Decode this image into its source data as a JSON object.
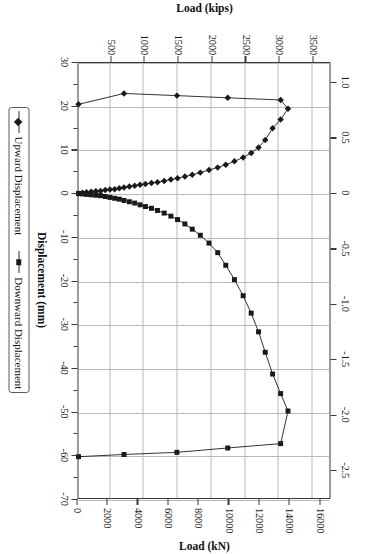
{
  "chart_data": {
    "type": "line",
    "title": "",
    "xlabel": "Displacement (mm)",
    "ylabel": "Load (kips)",
    "secondary_xlabel": "Displacement (in.)",
    "secondary_ylabel": "Load (kN)",
    "xlim": [
      30,
      -70
    ],
    "ylim": [
      0,
      3750
    ],
    "secondary_xlim": [
      1.18,
      -2.76
    ],
    "secondary_ylim": [
      0,
      16680
    ],
    "grid": true,
    "legend_position": "bottom",
    "x_ticks": [
      30,
      20,
      10,
      0,
      -10,
      -20,
      -30,
      -40,
      -50,
      -60,
      -70
    ],
    "x_tick_labels": [
      "30",
      "20",
      "10",
      "0",
      "-10",
      "-20",
      "-30",
      "-40",
      "-50",
      "-60",
      "-70"
    ],
    "y_ticks": [
      500,
      1000,
      1500,
      2000,
      2500,
      3000,
      3500
    ],
    "y_tick_labels": [
      "500",
      "1000",
      "1500",
      "2000",
      "2500",
      "3000",
      "3500"
    ],
    "top_ticks": [
      1.0,
      0.5,
      0,
      -0.5,
      -1.0,
      -1.5,
      -2.0,
      -2.5
    ],
    "top_tick_labels": [
      "1.0",
      "0.5",
      "0",
      "-0.5",
      "-1.0",
      "-1.5",
      "-2.0",
      "-2.5"
    ],
    "right_ticks": [
      0,
      2000,
      4000,
      6000,
      8000,
      10000,
      12000,
      14000,
      16000
    ],
    "right_tick_labels": [
      "0",
      "2000",
      "4000",
      "6000",
      "8000",
      "10000",
      "12000",
      "14000",
      "16000"
    ],
    "series": [
      {
        "name": "Upward Displacement",
        "marker": "diamond",
        "color": "#1a1a1a",
        "points": [
          [
            0,
            0
          ],
          [
            0.2,
            60
          ],
          [
            0.3,
            120
          ],
          [
            0.4,
            190
          ],
          [
            0.5,
            260
          ],
          [
            0.6,
            330
          ],
          [
            0.8,
            400
          ],
          [
            0.9,
            470
          ],
          [
            1.0,
            540
          ],
          [
            1.2,
            610
          ],
          [
            1.4,
            680
          ],
          [
            1.6,
            760
          ],
          [
            1.8,
            840
          ],
          [
            2.0,
            920
          ],
          [
            2.2,
            1000
          ],
          [
            2.4,
            1090
          ],
          [
            2.6,
            1180
          ],
          [
            2.9,
            1280
          ],
          [
            3.2,
            1380
          ],
          [
            3.5,
            1480
          ],
          [
            3.9,
            1590
          ],
          [
            4.3,
            1700
          ],
          [
            4.8,
            1820
          ],
          [
            5.4,
            1950
          ],
          [
            6.0,
            2080
          ],
          [
            6.6,
            2200
          ],
          [
            7.4,
            2330
          ],
          [
            8.3,
            2460
          ],
          [
            9.3,
            2580
          ],
          [
            10.6,
            2690
          ],
          [
            12.3,
            2790
          ],
          [
            15.0,
            2900
          ],
          [
            17.0,
            3020
          ],
          [
            19.5,
            3130
          ],
          [
            21.5,
            3020
          ],
          [
            22.0,
            2230
          ],
          [
            22.5,
            1470
          ],
          [
            23.0,
            680
          ],
          [
            20.5,
            0
          ]
        ]
      },
      {
        "name": "Downward Displacement",
        "marker": "square",
        "color": "#1a1a1a",
        "points": [
          [
            0,
            0
          ],
          [
            -0.1,
            60
          ],
          [
            -0.2,
            120
          ],
          [
            -0.3,
            190
          ],
          [
            -0.4,
            260
          ],
          [
            -0.5,
            330
          ],
          [
            -0.7,
            400
          ],
          [
            -0.9,
            470
          ],
          [
            -1.1,
            540
          ],
          [
            -1.3,
            610
          ],
          [
            -1.6,
            680
          ],
          [
            -1.9,
            760
          ],
          [
            -2.2,
            840
          ],
          [
            -2.6,
            920
          ],
          [
            -3.0,
            1000
          ],
          [
            -3.4,
            1090
          ],
          [
            -3.9,
            1180
          ],
          [
            -4.5,
            1280
          ],
          [
            -5.2,
            1380
          ],
          [
            -6.0,
            1480
          ],
          [
            -7.0,
            1590
          ],
          [
            -8.2,
            1700
          ],
          [
            -9.6,
            1820
          ],
          [
            -11.4,
            1950
          ],
          [
            -13.6,
            2080
          ],
          [
            -16.5,
            2200
          ],
          [
            -19.8,
            2330
          ],
          [
            -23.5,
            2460
          ],
          [
            -27.5,
            2580
          ],
          [
            -31.8,
            2690
          ],
          [
            -36.5,
            2790
          ],
          [
            -41.5,
            2900
          ],
          [
            -46.0,
            3020
          ],
          [
            -50.0,
            3130
          ],
          [
            -57.5,
            3020
          ],
          [
            -58.5,
            2230
          ],
          [
            -59.5,
            1470
          ],
          [
            -60.0,
            680
          ],
          [
            -60.5,
            0
          ]
        ]
      }
    ]
  },
  "legend": {
    "entries": [
      {
        "label": "Upward Displacement",
        "marker": "diamond"
      },
      {
        "label": "Downward Displacement",
        "marker": "square"
      }
    ]
  }
}
